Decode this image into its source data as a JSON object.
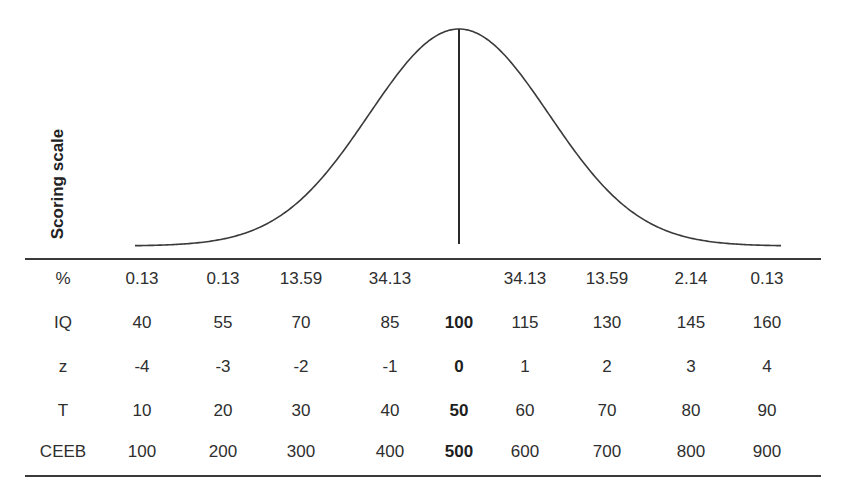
{
  "chart_data": {
    "type": "line",
    "title": "",
    "ylabel": "Scoring scale",
    "xlabel": "",
    "grid": false,
    "legend": null,
    "curve": {
      "kind": "normal_distribution",
      "mean_marker": true,
      "x_range_z": [
        -4,
        4
      ]
    },
    "table": {
      "rows": [
        {
          "label": "%",
          "values": [
            "0.13",
            "0.13",
            "13.59",
            "34.13",
            "",
            "34.13",
            "13.59",
            "2.14",
            "0.13"
          ]
        },
        {
          "label": "IQ",
          "values": [
            "40",
            "55",
            "70",
            "85",
            "100",
            "115",
            "130",
            "145",
            "160"
          ]
        },
        {
          "label": "z",
          "values": [
            "-4",
            "-3",
            "-2",
            "-1",
            "0",
            "1",
            "2",
            "3",
            "4"
          ]
        },
        {
          "label": "T",
          "values": [
            "10",
            "20",
            "30",
            "40",
            "50",
            "60",
            "70",
            "80",
            "90"
          ]
        },
        {
          "label": "CEEB",
          "values": [
            "100",
            "200",
            "300",
            "400",
            "500",
            "600",
            "700",
            "800",
            "900"
          ]
        }
      ],
      "bold_column_index": 4
    },
    "series": [
      {
        "name": "IQ",
        "values": [
          40,
          55,
          70,
          85,
          100,
          115,
          130,
          145,
          160
        ]
      },
      {
        "name": "z",
        "values": [
          -4,
          -3,
          -2,
          -1,
          0,
          1,
          2,
          3,
          4
        ]
      },
      {
        "name": "T",
        "values": [
          10,
          20,
          30,
          40,
          50,
          60,
          70,
          80,
          90
        ]
      },
      {
        "name": "CEEB",
        "values": [
          100,
          200,
          300,
          400,
          500,
          600,
          700,
          800,
          900
        ]
      }
    ],
    "percent_areas": [
      0.13,
      0.13,
      13.59,
      34.13,
      null,
      34.13,
      13.59,
      2.14,
      0.13
    ]
  },
  "labels": {
    "y_axis": "Scoring scale"
  },
  "colors": {
    "line": "#3a3a3a",
    "text": "#2e2e2e"
  }
}
